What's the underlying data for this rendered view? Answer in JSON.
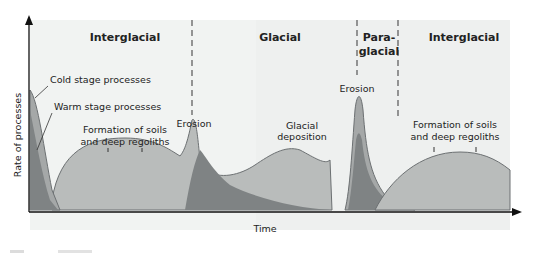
{
  "diagram": {
    "title": "",
    "phases": [
      {
        "label": "Interglacial",
        "x": 125
      },
      {
        "label": "Glacial",
        "x": 292
      },
      {
        "label_line1": "Para-",
        "label_line2": "glacial",
        "x": 383
      },
      {
        "label": "Interglacial",
        "x": 470
      }
    ],
    "axes": {
      "x_label": "Time",
      "y_label": "Rate of processes"
    },
    "annotations": {
      "cold_stage": "Cold stage processes",
      "warm_stage": "Warm stage processes",
      "soils_1_line1": "Formation of soils",
      "soils_1_line2": "and deep regoliths",
      "erosion_1": "Erosion",
      "glacial_dep_line1": "Glacial",
      "glacial_dep_line2": "deposition",
      "erosion_2": "Erosion",
      "soils_2_line1": "Formation of soils",
      "soils_2_line2": "and deep regoliths"
    },
    "colors": {
      "background_panel": "#eef0ef",
      "warm_fill": "#b9bcbb",
      "cold_fill": "#a5a8a8",
      "dark_fill": "#7f8384",
      "outline": "#6c7072",
      "axis": "#111111"
    }
  }
}
